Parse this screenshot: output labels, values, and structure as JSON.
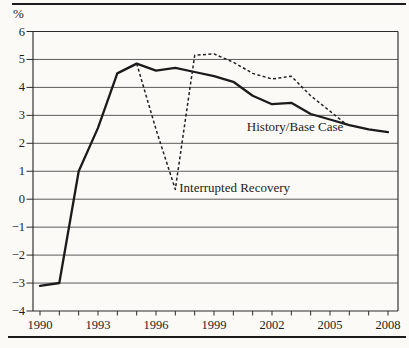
{
  "figure": {
    "unit_label": "%"
  },
  "colors": {
    "ink": "#1c1c1c",
    "paper": "#fbfaf7"
  },
  "chart_data": {
    "type": "line",
    "title": "",
    "xlabel": "",
    "ylabel": "%",
    "xlim": [
      1989.6,
      2008.5
    ],
    "ylim": [
      -4,
      6
    ],
    "grid": "horizontal",
    "legend_position": "inline-annotations",
    "y_ticks": [
      6,
      5,
      4,
      3,
      2,
      1,
      0,
      -1,
      -2,
      -3,
      -4
    ],
    "y_tick_labels": [
      "6",
      "5",
      "4",
      "3",
      "2",
      "1",
      "0",
      "−1",
      "−2",
      "−3",
      "−4"
    ],
    "x_ticks": [
      1990,
      1991,
      1992,
      1993,
      1994,
      1995,
      1996,
      1997,
      1998,
      1999,
      2000,
      2001,
      2002,
      2003,
      2004,
      2005,
      2006,
      2007,
      2008
    ],
    "x_tick_labels": [
      "1990",
      "1993",
      "1996",
      "1999",
      "2002",
      "2005",
      "2008"
    ],
    "x_label_years": [
      1990,
      1993,
      1996,
      1999,
      2002,
      2005,
      2008
    ],
    "series": [
      {
        "name": "History/Base Case",
        "line_style": "solid",
        "x": [
          1990,
          1991,
          1992,
          1993,
          1994,
          1995,
          1996,
          1997,
          1998,
          1999,
          2000,
          2001,
          2002,
          2003,
          2004,
          2005,
          2006,
          2007,
          2008
        ],
        "y": [
          -3.1,
          -3.0,
          1.0,
          2.55,
          4.5,
          4.85,
          4.6,
          4.7,
          4.55,
          4.4,
          4.2,
          3.7,
          3.4,
          3.45,
          3.05,
          2.85,
          2.65,
          2.5,
          2.4
        ]
      },
      {
        "name": "Interrupted Recovery",
        "line_style": "dashed",
        "x": [
          1995,
          1996,
          1997,
          1998,
          1999,
          2000,
          2001,
          2002,
          2003,
          2004,
          2005,
          2005.8
        ],
        "y": [
          4.85,
          2.5,
          0.35,
          5.15,
          5.2,
          4.9,
          4.5,
          4.3,
          4.4,
          3.7,
          3.15,
          2.7
        ]
      }
    ],
    "annotations": [
      {
        "text": "History/Base Case",
        "x": 2000.7,
        "y": 2.45,
        "anchor": "start"
      },
      {
        "text": "Interrupted Recovery",
        "x": 1997.2,
        "y": 0.25,
        "anchor": "start"
      }
    ]
  }
}
